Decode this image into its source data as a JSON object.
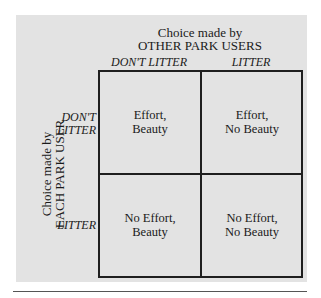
{
  "diagram": {
    "column_title": [
      "Choice made by",
      "OTHER PARK USERS"
    ],
    "row_title": [
      "Choice made by",
      "EACH PARK USER"
    ],
    "columns": [
      "DON'T LITTER",
      "LITTER"
    ],
    "rows": [
      [
        "DON'T",
        "LITTER"
      ],
      [
        "LITTER"
      ]
    ],
    "cells": [
      [
        [
          "Effort,",
          "Beauty"
        ],
        [
          "Effort,",
          "No Beauty"
        ]
      ],
      [
        [
          "No Effort,",
          "Beauty"
        ],
        [
          "No Effort,",
          "No Beauty"
        ]
      ]
    ],
    "colors": {
      "panel_bg": "#e3e3e3",
      "line": "#1f1f1f"
    }
  }
}
